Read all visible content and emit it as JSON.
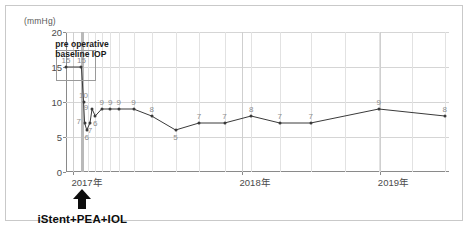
{
  "chart": {
    "unit_label": "(mmHg)",
    "annotation_baseline": "pre operative\nbaseline IOP",
    "annotation_baseline_line1": "pre operative",
    "annotation_baseline_line2": "baseline IOP",
    "procedure_label": "iStent+PEA+IOL",
    "accent_color": "#3a3a3a",
    "marker_color": "#b9b9b9",
    "label_color": "#8d8d8d"
  },
  "chart_data": {
    "type": "line",
    "title": "",
    "xlabel": "",
    "ylabel": "",
    "unit": "(mmHg)",
    "ylim": [
      0,
      20
    ],
    "yticks": [
      0,
      5,
      10,
      15,
      20
    ],
    "xlim": [
      0,
      36
    ],
    "xtick_labels": [
      "2017年",
      "2018年",
      "2019年"
    ],
    "xtick_positions": [
      0.7,
      16.5,
      29.5
    ],
    "grid": true,
    "legend": "none",
    "annotations": [
      {
        "text": "pre operative baseline IOP",
        "target": "first two points"
      },
      {
        "text": "iStent+PEA+IOL",
        "target": "surgery time point",
        "marker": "up-arrow"
      }
    ],
    "series": [
      {
        "name": "IOP",
        "points": [
          {
            "x": 0.0,
            "y": 15,
            "label": "15",
            "label_pos": "above"
          },
          {
            "x": 1.45,
            "y": 15,
            "label": "15",
            "label_pos": "above"
          },
          {
            "x": 1.65,
            "y": 10,
            "label": "10",
            "label_pos": "above"
          },
          {
            "x": 1.75,
            "y": 7,
            "label": "7",
            "label_pos": "left"
          },
          {
            "x": 1.95,
            "y": 6,
            "label": "6",
            "label_pos": "below"
          },
          {
            "x": 2.25,
            "y": 7,
            "label": "7",
            "label_pos": "below"
          },
          {
            "x": 2.45,
            "y": 9,
            "label": "9",
            "label_pos": "left"
          },
          {
            "x": 2.75,
            "y": 8,
            "label": "6",
            "label_pos": "below"
          },
          {
            "x": 3.35,
            "y": 9,
            "label": "9",
            "label_pos": "above"
          },
          {
            "x": 4.15,
            "y": 9,
            "label": "9",
            "label_pos": "above"
          },
          {
            "x": 4.95,
            "y": 9,
            "label": "9",
            "label_pos": "above"
          },
          {
            "x": 6.35,
            "y": 9,
            "label": "9",
            "label_pos": "above"
          },
          {
            "x": 8.05,
            "y": 8,
            "label": "8",
            "label_pos": "above"
          },
          {
            "x": 10.3,
            "y": 6,
            "label": "5",
            "label_pos": "below"
          },
          {
            "x": 12.5,
            "y": 7,
            "label": "7",
            "label_pos": "above"
          },
          {
            "x": 14.9,
            "y": 7,
            "label": "7",
            "label_pos": "above"
          },
          {
            "x": 17.4,
            "y": 8,
            "label": "8",
            "label_pos": "above"
          },
          {
            "x": 20.1,
            "y": 7,
            "label": "7",
            "label_pos": "above"
          },
          {
            "x": 23.0,
            "y": 7,
            "label": "7",
            "label_pos": "above"
          },
          {
            "x": 29.4,
            "y": 9,
            "label": "9",
            "label_pos": "above"
          },
          {
            "x": 35.6,
            "y": 8,
            "label": "8",
            "label_pos": "above"
          }
        ]
      }
    ],
    "vertical_marker": {
      "x": 1.55,
      "label": "surgery"
    },
    "minor_vertical_gridlines": [
      2.1,
      2.7,
      3.35,
      4.15,
      4.95,
      6.35,
      8.05,
      10.3,
      12.5,
      14.9,
      17.4,
      20.1,
      23.0,
      26.2,
      29.4,
      32.5,
      35.6
    ],
    "baseline_box": {
      "x0": -0.9,
      "x1": 2.6,
      "y0": 13.3,
      "y1": 17.4
    }
  }
}
